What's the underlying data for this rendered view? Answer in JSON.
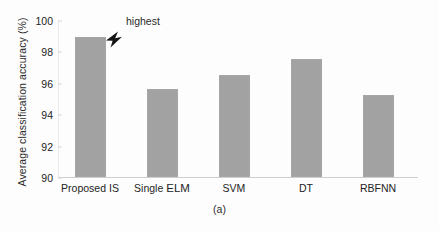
{
  "chart_data": {
    "type": "bar",
    "title": "",
    "subtitle": "",
    "xlabel": "",
    "ylabel": "Average classification accuracy (%)",
    "categories": [
      "Proposed IS",
      "Single ELM",
      "SVM",
      "DT",
      "RBFNN"
    ],
    "values": [
      98.9,
      95.6,
      96.5,
      97.5,
      95.2
    ],
    "ylim": [
      90,
      100
    ],
    "yticks": [
      90,
      92,
      94,
      96,
      98,
      100
    ],
    "ytick_labels": [
      "90",
      "92",
      "94",
      "96",
      "98",
      "100"
    ],
    "grid": false,
    "legend": null,
    "bar_color": "#a2a2a2",
    "annotations": [
      {
        "text": "highest",
        "target_category": "Proposed IS",
        "target_value": 98.9,
        "marker": "arrow-down-left"
      }
    ]
  },
  "caption": "(a)",
  "icons": {
    "annotation_arrow": "arrow-icon"
  }
}
